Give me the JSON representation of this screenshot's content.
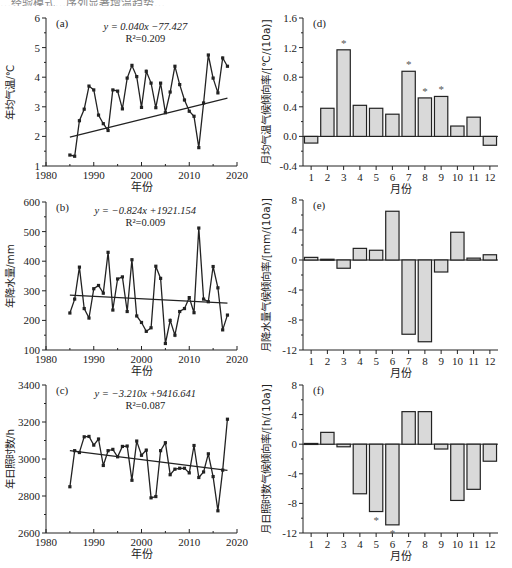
{
  "header_fragment": "…经验模式…序列显著增温趋势…",
  "chart_data": [
    {
      "id": "a",
      "panel_label": "(a)",
      "type": "line",
      "xlabel": "年份",
      "ylabel": "年均气温/℃",
      "xlim": [
        1980,
        2020
      ],
      "ylim": [
        1,
        6
      ],
      "xticks": [
        1980,
        1990,
        2000,
        2010,
        2020
      ],
      "yticks": [
        1,
        2,
        3,
        4,
        5,
        6
      ],
      "equation": "y = 0.040x −77.427",
      "r2": "R²=0.209",
      "trend": {
        "slope": 0.04,
        "intercept": -77.427
      },
      "x": [
        1985,
        1986,
        1987,
        1988,
        1989,
        1990,
        1991,
        1992,
        1993,
        1994,
        1995,
        1996,
        1997,
        1998,
        1999,
        2000,
        2001,
        2002,
        2003,
        2004,
        2005,
        2006,
        2007,
        2008,
        2009,
        2010,
        2011,
        2012,
        2013,
        2014,
        2015,
        2016,
        2017,
        2018
      ],
      "values": [
        1.37,
        1.33,
        2.53,
        2.92,
        3.7,
        3.57,
        2.72,
        2.43,
        2.2,
        3.57,
        3.53,
        2.93,
        3.97,
        4.4,
        4.02,
        2.98,
        4.2,
        3.8,
        2.97,
        3.8,
        2.8,
        3.5,
        4.37,
        3.75,
        3.23,
        2.85,
        2.68,
        1.62,
        3.13,
        4.75,
        3.97,
        3.47,
        4.65,
        4.37
      ],
      "grid": false
    },
    {
      "id": "b",
      "panel_label": "(b)",
      "type": "line",
      "xlabel": "年份",
      "ylabel": "年降水量/mm",
      "xlim": [
        1980,
        2020
      ],
      "ylim": [
        100,
        600
      ],
      "xticks": [
        1980,
        1990,
        2000,
        2010,
        2020
      ],
      "yticks": [
        100,
        200,
        300,
        400,
        500,
        600
      ],
      "equation": "y = −0.824x +1921.154",
      "r2": "R²=0.009",
      "trend": {
        "slope": -0.824,
        "intercept": 1921.154
      },
      "x": [
        1985,
        1986,
        1987,
        1988,
        1989,
        1990,
        1991,
        1992,
        1993,
        1994,
        1995,
        1996,
        1997,
        1998,
        1999,
        2000,
        2001,
        2002,
        2003,
        2004,
        2005,
        2006,
        2007,
        2008,
        2009,
        2010,
        2011,
        2012,
        2013,
        2014,
        2015,
        2016,
        2017,
        2018
      ],
      "values": [
        225,
        272,
        380,
        240,
        208,
        307,
        318,
        292,
        430,
        235,
        340,
        347,
        230,
        405,
        215,
        193,
        163,
        175,
        383,
        342,
        122,
        200,
        150,
        230,
        240,
        277,
        226,
        512,
        272,
        263,
        382,
        310,
        168,
        218
      ],
      "grid": false
    },
    {
      "id": "c",
      "panel_label": "(c)",
      "type": "line",
      "xlabel": "年份",
      "ylabel": "年日照时数/h",
      "xlim": [
        1980,
        2020
      ],
      "ylim": [
        2600,
        3400
      ],
      "xticks": [
        1980,
        1990,
        2000,
        2010,
        2020
      ],
      "yticks": [
        2600,
        2800,
        3000,
        3200,
        3400
      ],
      "equation": "y = −3.210x +9416.641",
      "r2": "R²=0.087",
      "trend": {
        "slope": -3.21,
        "intercept": 9416.641
      },
      "x": [
        1985,
        1986,
        1987,
        1988,
        1989,
        1990,
        1991,
        1992,
        1993,
        1994,
        1995,
        1996,
        1997,
        1998,
        1999,
        2000,
        2001,
        2002,
        2003,
        2004,
        2005,
        2006,
        2007,
        2008,
        2009,
        2010,
        2011,
        2012,
        2013,
        2014,
        2015,
        2016,
        2017,
        2018
      ],
      "values": [
        2850,
        3045,
        3035,
        3120,
        3122,
        3075,
        3108,
        2965,
        3045,
        3052,
        3012,
        3068,
        3070,
        2885,
        3097,
        3020,
        3048,
        2790,
        2797,
        3045,
        3088,
        2915,
        2945,
        2950,
        2950,
        2925,
        3073,
        2900,
        2930,
        3028,
        2905,
        2720,
        2940,
        3215
      ],
      "grid": false
    },
    {
      "id": "d",
      "panel_label": "(d)",
      "type": "bar",
      "xlabel": "月份",
      "ylabel": "月均气温气候倾向率/[℃/(10a)]",
      "ylim": [
        -0.4,
        1.6
      ],
      "yticks": [
        -0.4,
        0.0,
        0.4,
        0.8,
        1.2,
        1.6
      ],
      "ytick_labels": [
        "-0.4",
        "0.0",
        "0.4",
        "0.8",
        "1.2",
        "1.6"
      ],
      "categories": [
        "1",
        "2",
        "3",
        "4",
        "5",
        "6",
        "7",
        "8",
        "9",
        "10",
        "11",
        "12"
      ],
      "values": [
        -0.09,
        0.38,
        1.17,
        0.42,
        0.38,
        0.3,
        0.88,
        0.52,
        0.54,
        0.14,
        0.26,
        -0.12
      ],
      "significant": [
        false,
        false,
        true,
        false,
        false,
        false,
        true,
        true,
        true,
        false,
        false,
        false
      ],
      "significance_marker": "*"
    },
    {
      "id": "e",
      "panel_label": "(e)",
      "type": "bar",
      "xlabel": "月份",
      "ylabel": "月降水量气候倾向率/[mm/(10a)]",
      "ylim": [
        -12,
        8
      ],
      "yticks": [
        -12,
        -8,
        -4,
        0,
        4,
        8
      ],
      "ytick_labels": [
        "-12",
        "-8",
        "-4",
        "0",
        "4",
        "8"
      ],
      "categories": [
        "1",
        "2",
        "3",
        "4",
        "5",
        "6",
        "7",
        "8",
        "9",
        "10",
        "11",
        "12"
      ],
      "values": [
        0.35,
        0.1,
        -1.1,
        1.55,
        1.3,
        6.5,
        -9.9,
        -10.9,
        -1.6,
        3.7,
        0.25,
        0.7
      ],
      "significant": [
        false,
        false,
        false,
        false,
        false,
        false,
        false,
        false,
        false,
        false,
        false,
        false
      ],
      "significance_marker": "*"
    },
    {
      "id": "f",
      "panel_label": "(f)",
      "type": "bar",
      "xlabel": "月份",
      "ylabel": "月日照时数气候倾向率/[h/(10a)]",
      "ylim": [
        -12,
        8
      ],
      "yticks": [
        -12,
        -8,
        -4,
        0,
        4,
        8
      ],
      "ytick_labels": [
        "-12",
        "-8",
        "-4",
        "0",
        "4",
        "8"
      ],
      "categories": [
        "1",
        "2",
        "3",
        "4",
        "5",
        "6",
        "7",
        "8",
        "9",
        "10",
        "11",
        "12"
      ],
      "values": [
        0.1,
        1.6,
        -0.35,
        -6.7,
        -9.1,
        -10.9,
        4.4,
        4.4,
        -0.65,
        -7.6,
        -6.1,
        -2.3
      ],
      "significant": [
        false,
        false,
        false,
        false,
        true,
        true,
        false,
        false,
        false,
        false,
        false,
        false
      ],
      "significance_marker": "*"
    }
  ]
}
